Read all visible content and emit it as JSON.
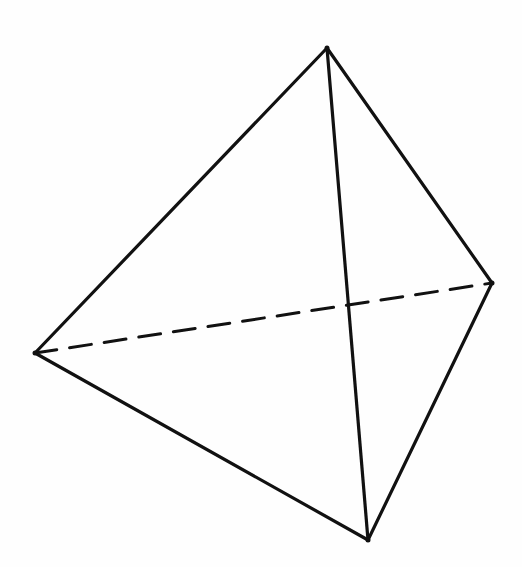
{
  "diagram": {
    "title": "",
    "type": "tetrahedron-line-drawing",
    "stroke_color": "#111111",
    "background_color": "#fefefe",
    "vertices": {
      "top": [
        327,
        48
      ],
      "left": [
        35,
        353
      ],
      "right": [
        492,
        283
      ],
      "bottom": [
        368,
        540
      ]
    },
    "edges": [
      {
        "from": "top",
        "to": "left",
        "style": "solid"
      },
      {
        "from": "top",
        "to": "right",
        "style": "solid"
      },
      {
        "from": "top",
        "to": "bottom",
        "style": "solid"
      },
      {
        "from": "left",
        "to": "bottom",
        "style": "solid"
      },
      {
        "from": "right",
        "to": "bottom",
        "style": "solid"
      },
      {
        "from": "left",
        "to": "right",
        "style": "dashed"
      }
    ]
  }
}
